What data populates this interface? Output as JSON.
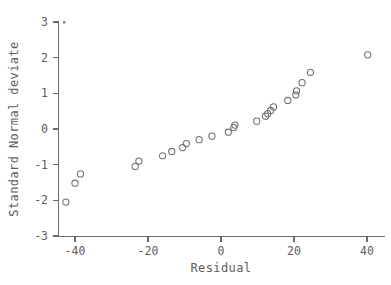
{
  "chart_data": {
    "type": "scatter",
    "title": "",
    "subtitle": "",
    "xlabel": "Residual",
    "ylabel": "Standard Normal deviate",
    "xlim": [
      -45,
      45
    ],
    "ylim": [
      -3,
      3
    ],
    "xticks": [
      -40,
      -20,
      0,
      20,
      40
    ],
    "xtick_labels": [
      "-40",
      "-20",
      "0",
      "20",
      "40"
    ],
    "yticks": [
      -3,
      -2,
      -1,
      0,
      1,
      2,
      3
    ],
    "ytick_labels": [
      "-3",
      "-2",
      "-1",
      "0",
      "1",
      "2",
      "3"
    ],
    "grid": false,
    "legend": null,
    "marker": "open-circle",
    "marker_color": "#6f6f6f",
    "points": [
      {
        "x": -42.5,
        "y": -2.05
      },
      {
        "x": -40.0,
        "y": -1.52
      },
      {
        "x": -38.5,
        "y": -1.26
      },
      {
        "x": -23.5,
        "y": -1.05
      },
      {
        "x": -22.5,
        "y": -0.9
      },
      {
        "x": -16.0,
        "y": -0.75
      },
      {
        "x": -13.5,
        "y": -0.63
      },
      {
        "x": -10.5,
        "y": -0.52
      },
      {
        "x": -9.5,
        "y": -0.41
      },
      {
        "x": -6.0,
        "y": -0.3
      },
      {
        "x": -2.5,
        "y": -0.2
      },
      {
        "x": 2.0,
        "y": -0.09
      },
      {
        "x": 3.5,
        "y": 0.04
      },
      {
        "x": 3.8,
        "y": 0.11
      },
      {
        "x": 9.8,
        "y": 0.22
      },
      {
        "x": 12.2,
        "y": 0.36
      },
      {
        "x": 12.8,
        "y": 0.43
      },
      {
        "x": 13.6,
        "y": 0.52
      },
      {
        "x": 14.4,
        "y": 0.62
      },
      {
        "x": 18.3,
        "y": 0.8
      },
      {
        "x": 20.5,
        "y": 0.96
      },
      {
        "x": 20.7,
        "y": 1.07
      },
      {
        "x": 22.2,
        "y": 1.3
      },
      {
        "x": 24.5,
        "y": 1.59
      },
      {
        "x": 40.2,
        "y": 2.08
      }
    ]
  },
  "axes": {
    "x_title": "Residual",
    "y_title": "Standard Normal deviate"
  }
}
